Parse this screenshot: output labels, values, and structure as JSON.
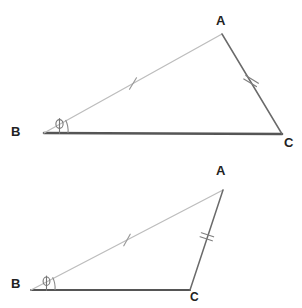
{
  "figure": {
    "background_color": "#ffffff",
    "width": 302,
    "height": 308,
    "colors": {
      "base_line": "#555555",
      "hypotenuse_line": "#b8b8b8",
      "right_side_line": "#6a6a6a",
      "tick_mark": "#8a8a8a",
      "angle_arc": "#777777",
      "label_text": "#222222",
      "crop_artifact": "#d8d8d8"
    },
    "cropped_glyph_top": "φ"
  },
  "diagrams": [
    {
      "id": "triangle-top",
      "name": "Large triangle ABC",
      "vertices": {
        "A": {
          "label": "A",
          "x": 222,
          "y": 34,
          "label_x": 216,
          "label_y": 14
        },
        "B": {
          "label": "B",
          "x": 44,
          "y": 133,
          "label_x": 11,
          "label_y": 125
        },
        "C": {
          "label": "C",
          "x": 282,
          "y": 134,
          "label_x": 284,
          "label_y": 136
        }
      },
      "sides": [
        {
          "name": "AB",
          "from": "B",
          "to": "A",
          "ticks": 1,
          "style": "light"
        },
        {
          "name": "AC",
          "from": "A",
          "to": "C",
          "ticks": 2,
          "style": "medium"
        },
        {
          "name": "BC",
          "from": "B",
          "to": "C",
          "ticks": 0,
          "style": "dark"
        }
      ],
      "angle_marker": {
        "at": "B",
        "symbol": "φ",
        "label": "phi"
      }
    },
    {
      "id": "triangle-bottom",
      "name": "Small triangle ABC",
      "vertices": {
        "A": {
          "label": "A",
          "x": 223,
          "y": 190,
          "label_x": 216,
          "label_y": 164
        },
        "B": {
          "label": "B",
          "x": 31,
          "y": 290,
          "label_x": 11,
          "label_y": 277
        },
        "C": {
          "label": "C",
          "x": 190,
          "y": 290,
          "label_x": 190,
          "label_y": 291
        }
      },
      "sides": [
        {
          "name": "AB",
          "from": "B",
          "to": "A",
          "ticks": 1,
          "style": "light"
        },
        {
          "name": "AC",
          "from": "A",
          "to": "C",
          "ticks": 2,
          "style": "medium"
        },
        {
          "name": "BC",
          "from": "B",
          "to": "C",
          "ticks": 0,
          "style": "dark"
        }
      ],
      "angle_marker": {
        "at": "B",
        "symbol": "φ",
        "label": "phi"
      }
    }
  ]
}
